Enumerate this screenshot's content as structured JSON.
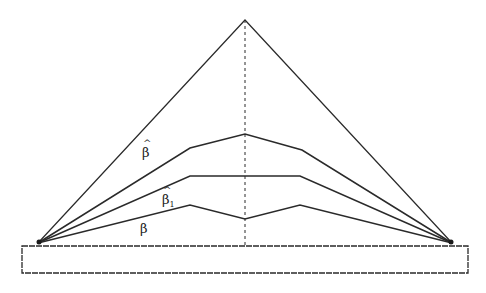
{
  "diagram": {
    "colors": {
      "stroke": "#2a2a2a",
      "background": "#ffffff"
    },
    "apex": [
      245,
      20
    ],
    "left_anchor": [
      38,
      243
    ],
    "right_anchor": [
      452,
      243
    ],
    "base_rect": {
      "x": 22,
      "y": 246,
      "width": 446,
      "height": 27
    },
    "center_line": {
      "x": 245,
      "y1": 20,
      "y2": 246,
      "style": "dashed"
    },
    "curves": [
      {
        "id": "beta-hat",
        "points": [
          [
            38,
            243
          ],
          [
            190,
            148
          ],
          [
            245,
            134
          ],
          [
            302,
            150
          ],
          [
            452,
            243
          ]
        ]
      },
      {
        "id": "beta-hat-1",
        "points": [
          [
            38,
            243
          ],
          [
            190,
            176
          ],
          [
            300,
            176
          ],
          [
            452,
            243
          ]
        ]
      },
      {
        "id": "beta",
        "points": [
          [
            38,
            243
          ],
          [
            190,
            205
          ],
          [
            245,
            219
          ],
          [
            300,
            205
          ],
          [
            452,
            243
          ]
        ]
      }
    ],
    "labels": [
      {
        "id": "beta-hat",
        "base": "β",
        "hat": true,
        "sub": "",
        "x": 142,
        "y": 146
      },
      {
        "id": "beta-hat-1",
        "base": "β",
        "hat": true,
        "sub": "1",
        "x": 162,
        "y": 196
      },
      {
        "id": "beta",
        "base": "β",
        "hat": false,
        "sub": "",
        "x": 140,
        "y": 224
      }
    ]
  }
}
